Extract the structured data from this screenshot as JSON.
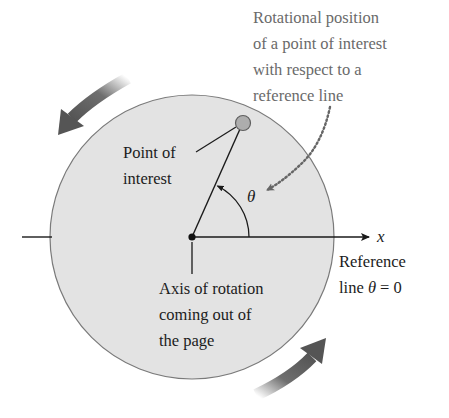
{
  "figure": {
    "callout_top": {
      "lines": [
        "Rotational position",
        "of a point of interest",
        "with respect to a",
        "reference line"
      ]
    },
    "point_label": {
      "lines": [
        "Point of",
        "interest"
      ]
    },
    "axis_label": {
      "lines": [
        "Axis of rotation",
        "coming out of",
        "the page"
      ]
    },
    "reference_label": {
      "line1": "Reference",
      "line2_prefix": "line ",
      "line2_symbol": "θ",
      "line2_suffix": " = 0"
    },
    "angle_symbol": "θ",
    "axis_name": "x",
    "colors": {
      "disk_fill": "#e3e3e3",
      "disk_stroke": "#7a7a7a",
      "line": "#1a1a1a",
      "point_fill": "#adadad",
      "point_stroke": "#5e5e5e",
      "rotation_arrow": "#555555",
      "callout_text": "#6a6a6a",
      "dotted_arrow": "#666666"
    },
    "rotation_direction": "counterclockwise"
  }
}
